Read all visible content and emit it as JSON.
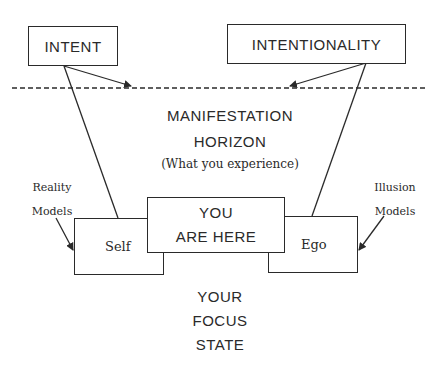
{
  "diagram": {
    "boxes": {
      "intent": "INTENT",
      "intentionality": "INTENTIONALITY",
      "self": "Self",
      "you_are_here_line1": "YOU",
      "you_are_here_line2": "ARE HERE",
      "ego": "Ego"
    },
    "horizon": {
      "line1": "MANIFESTATION",
      "line2": "HORIZON",
      "subtitle": "(What you experience)"
    },
    "side_labels": {
      "reality_line1": "Reality",
      "reality_line2": "Models",
      "illusion_line1": "Illusion",
      "illusion_line2": "Models"
    },
    "focus_state": {
      "line1": "YOUR",
      "line2": "FOCUS",
      "line3": "STATE"
    },
    "colors": {
      "ink": "#2a2a2a",
      "background": "#ffffff"
    }
  }
}
